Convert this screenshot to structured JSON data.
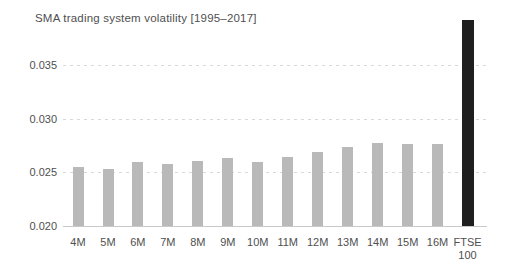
{
  "chart": {
    "title": "SMA trading system volatility [1995–2017]"
  },
  "chart_data": {
    "type": "bar",
    "title": "SMA trading system volatility [1995–2017]",
    "categories": [
      "4M",
      "5M",
      "6M",
      "7M",
      "8M",
      "9M",
      "10M",
      "11M",
      "12M",
      "13M",
      "14M",
      "15M",
      "16M",
      "FTSE\n100"
    ],
    "values": [
      0.0255,
      0.0253,
      0.026,
      0.0258,
      0.0261,
      0.0263,
      0.026,
      0.0264,
      0.0269,
      0.0274,
      0.0277,
      0.0276,
      0.0276,
      0.0392
    ],
    "highlight_index": 13,
    "xlabel": "",
    "ylabel": "",
    "ylim": [
      0.02,
      0.0395
    ],
    "yticks": [
      0.02,
      0.025,
      0.03,
      0.035
    ],
    "ytick_labels": [
      "0.020",
      "0.025",
      "0.030",
      "0.035"
    ],
    "grid": "horizontal dashed lines at 0.025, 0.030, 0.035; solid baseline at 0.020",
    "legend_position": "none",
    "colors": {
      "bar_default": "#b9b9b9",
      "bar_highlight": "#1f1f1f",
      "text": "#4f4f4f",
      "gridline": "#d9d9d9",
      "baseline": "#c9c9c9",
      "background": "#ffffff"
    }
  }
}
